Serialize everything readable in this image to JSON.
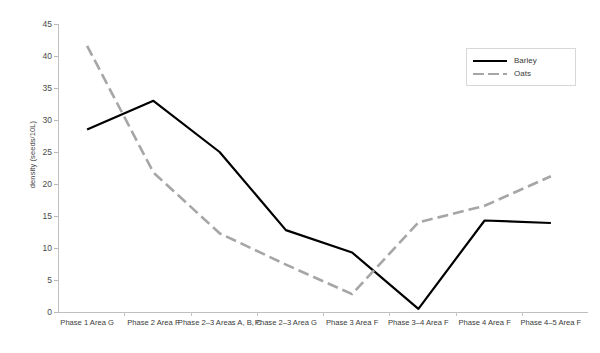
{
  "chart_data": {
    "type": "line",
    "title": "",
    "xlabel": "",
    "ylabel": "density (seeds/10L)",
    "ylim": [
      0,
      45
    ],
    "ytick_step": 5,
    "grid": false,
    "legend_position": "top-right",
    "categories": [
      "Phase 1 Area G",
      "Phase 2 Area F",
      "Phase 2–3 Areas A, B, C",
      "Phase 2–3 Area G",
      "Phase 3 Area F",
      "Phase  3–4 Area F",
      "Phase 4 Area F",
      "Phase 4–5 Area F"
    ],
    "yticks": [
      "0",
      "5",
      "10",
      "15",
      "20",
      "25",
      "30",
      "35",
      "40",
      "45"
    ],
    "series": [
      {
        "name": "Barley",
        "style": "solid",
        "color": "#000000",
        "values": [
          28.5,
          33.0,
          25.0,
          12.8,
          9.3,
          0.5,
          14.3,
          13.9
        ]
      },
      {
        "name": "Oats",
        "style": "dashed",
        "color": "#a6a6a6",
        "values": [
          41.6,
          21.8,
          12.3,
          7.4,
          2.8,
          14.0,
          16.6,
          21.2
        ]
      }
    ]
  },
  "legend": {
    "items": [
      {
        "label": "Barley"
      },
      {
        "label": "Oats"
      }
    ]
  }
}
